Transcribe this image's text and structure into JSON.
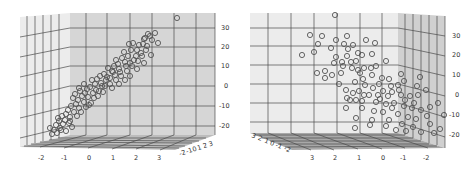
{
  "chart_data": [
    {
      "type": "scatter",
      "projection": "3d",
      "title": "",
      "view": "left panel, viewed with x-axis along bottom front edge",
      "xlabel": "",
      "ylabel": "",
      "zlabel": "",
      "x_ticks": [
        "-2",
        "-1",
        "0",
        "1",
        "2",
        "3"
      ],
      "y_ticks": [
        "-2",
        "-1",
        "0",
        "1",
        "2",
        "3"
      ],
      "z_ticks": [
        "30",
        "20",
        "10",
        "0",
        "-10",
        "-20"
      ],
      "xlim": [
        -2.5,
        3.5
      ],
      "ylim": [
        -2.5,
        3.5
      ],
      "zlim": [
        -25,
        35
      ],
      "grid": true,
      "marker": "open circle",
      "trend": "strong positive linear relation between x and z",
      "points_screen": [
        [
          177,
          18
        ],
        [
          155,
          33
        ],
        [
          158,
          43
        ],
        [
          145,
          38
        ],
        [
          148,
          34
        ],
        [
          150,
          36
        ],
        [
          143,
          44
        ],
        [
          144,
          39
        ],
        [
          152,
          40
        ],
        [
          139,
          45
        ],
        [
          147,
          46
        ],
        [
          137,
          50
        ],
        [
          141,
          53
        ],
        [
          136,
          56
        ],
        [
          131,
          50
        ],
        [
          128,
          56
        ],
        [
          134,
          60
        ],
        [
          125,
          62
        ],
        [
          130,
          63
        ],
        [
          122,
          58
        ],
        [
          118,
          64
        ],
        [
          126,
          66
        ],
        [
          119,
          69
        ],
        [
          114,
          66
        ],
        [
          112,
          71
        ],
        [
          120,
          72
        ],
        [
          108,
          68
        ],
        [
          115,
          75
        ],
        [
          110,
          78
        ],
        [
          104,
          74
        ],
        [
          106,
          80
        ],
        [
          100,
          76
        ],
        [
          101,
          83
        ],
        [
          97,
          79
        ],
        [
          95,
          84
        ],
        [
          102,
          86
        ],
        [
          92,
          80
        ],
        [
          90,
          87
        ],
        [
          96,
          90
        ],
        [
          87,
          89
        ],
        [
          93,
          93
        ],
        [
          85,
          93
        ],
        [
          88,
          97
        ],
        [
          82,
          96
        ],
        [
          80,
          91
        ],
        [
          78,
          100
        ],
        [
          84,
          102
        ],
        [
          76,
          104
        ],
        [
          73,
          98
        ],
        [
          71,
          106
        ],
        [
          79,
          108
        ],
        [
          68,
          110
        ],
        [
          74,
          112
        ],
        [
          66,
          114
        ],
        [
          70,
          117
        ],
        [
          62,
          116
        ],
        [
          65,
          120
        ],
        [
          59,
          121
        ],
        [
          63,
          124
        ],
        [
          56,
          125
        ],
        [
          60,
          128
        ],
        [
          54,
          130
        ],
        [
          52,
          134
        ],
        [
          57,
          133
        ],
        [
          50,
          128
        ],
        [
          72,
          127
        ],
        [
          66,
          131
        ],
        [
          61,
          130
        ],
        [
          89,
          105
        ],
        [
          94,
          98
        ],
        [
          99,
          91
        ],
        [
          105,
          86
        ],
        [
          110,
          84
        ],
        [
          116,
          80
        ],
        [
          121,
          76
        ],
        [
          127,
          71
        ],
        [
          132,
          66
        ],
        [
          138,
          61
        ],
        [
          142,
          56
        ],
        [
          146,
          50
        ],
        [
          113,
          72
        ],
        [
          107,
          77
        ],
        [
          103,
          92
        ],
        [
          98,
          96
        ],
        [
          91,
          103
        ],
        [
          86,
          107
        ],
        [
          81,
          112
        ],
        [
          77,
          116
        ],
        [
          70,
          121
        ],
        [
          116,
          60
        ],
        [
          124,
          52
        ],
        [
          119,
          84
        ],
        [
          112,
          88
        ],
        [
          84,
          84
        ],
        [
          79,
          88
        ],
        [
          133,
          43
        ],
        [
          129,
          44
        ],
        [
          151,
          55
        ],
        [
          144,
          63
        ],
        [
          137,
          69
        ],
        [
          130,
          76
        ],
        [
          125,
          80
        ],
        [
          69,
          123
        ],
        [
          58,
          118
        ],
        [
          75,
          94
        ]
      ]
    },
    {
      "type": "scatter",
      "projection": "3d",
      "title": "",
      "view": "right panel, rotated view with x-axis reversed along bottom front edge",
      "xlabel": "",
      "ylabel": "",
      "zlabel": "",
      "x_ticks": [
        "3",
        "2",
        "1",
        "0",
        "-1",
        "-2"
      ],
      "y_ticks": [
        "3",
        "2",
        "1",
        "0",
        "-1",
        "-2"
      ],
      "z_ticks": [
        "30",
        "20",
        "10",
        "0",
        "-10",
        "-20"
      ],
      "xlim": [
        3.5,
        -2.5
      ],
      "ylim": [
        3.5,
        -2.5
      ],
      "zlim": [
        -25,
        35
      ],
      "grid": true,
      "marker": "open circle",
      "trend": "points spread widely, cloud descends toward lower right",
      "points_screen": [
        [
          335,
          15
        ],
        [
          310,
          35
        ],
        [
          318,
          44
        ],
        [
          302,
          55
        ],
        [
          314,
          52
        ],
        [
          322,
          36
        ],
        [
          336,
          40
        ],
        [
          347,
          36
        ],
        [
          344,
          44
        ],
        [
          366,
          40
        ],
        [
          331,
          48
        ],
        [
          336,
          57
        ],
        [
          347,
          56
        ],
        [
          358,
          53
        ],
        [
          362,
          55
        ],
        [
          372,
          54
        ],
        [
          334,
          63
        ],
        [
          342,
          62
        ],
        [
          351,
          62
        ],
        [
          356,
          61
        ],
        [
          386,
          61
        ],
        [
          317,
          73
        ],
        [
          325,
          71
        ],
        [
          352,
          68
        ],
        [
          358,
          70
        ],
        [
          364,
          68
        ],
        [
          371,
          68
        ],
        [
          376,
          66
        ],
        [
          325,
          78
        ],
        [
          332,
          75
        ],
        [
          341,
          73
        ],
        [
          360,
          73
        ],
        [
          372,
          75
        ],
        [
          382,
          78
        ],
        [
          389,
          79
        ],
        [
          401,
          74
        ],
        [
          420,
          77
        ],
        [
          391,
          86
        ],
        [
          398,
          85
        ],
        [
          404,
          81
        ],
        [
          379,
          84
        ],
        [
          365,
          85
        ],
        [
          373,
          88
        ],
        [
          383,
          91
        ],
        [
          353,
          93
        ],
        [
          346,
          90
        ],
        [
          359,
          91
        ],
        [
          369,
          95
        ],
        [
          378,
          95
        ],
        [
          388,
          96
        ],
        [
          392,
          92
        ],
        [
          401,
          95
        ],
        [
          410,
          96
        ],
        [
          418,
          95
        ],
        [
          426,
          90
        ],
        [
          347,
          98
        ],
        [
          356,
          100
        ],
        [
          362,
          101
        ],
        [
          376,
          102
        ],
        [
          386,
          104
        ],
        [
          394,
          103
        ],
        [
          404,
          106
        ],
        [
          412,
          108
        ],
        [
          421,
          110
        ],
        [
          430,
          107
        ],
        [
          438,
          103
        ],
        [
          346,
          108
        ],
        [
          362,
          108
        ],
        [
          374,
          111
        ],
        [
          383,
          112
        ],
        [
          398,
          114
        ],
        [
          408,
          117
        ],
        [
          416,
          119
        ],
        [
          427,
          116
        ],
        [
          444,
          115
        ],
        [
          356,
          118
        ],
        [
          372,
          120
        ],
        [
          389,
          120
        ],
        [
          402,
          124
        ],
        [
          413,
          127
        ],
        [
          430,
          124
        ],
        [
          440,
          129
        ],
        [
          355,
          128
        ],
        [
          370,
          125
        ],
        [
          386,
          126
        ],
        [
          396,
          130
        ],
        [
          406,
          131
        ],
        [
          421,
          132
        ],
        [
          434,
          133
        ],
        [
          350,
          100
        ],
        [
          364,
          95
        ],
        [
          380,
          99
        ],
        [
          392,
          108
        ],
        [
          405,
          100
        ],
        [
          414,
          103
        ],
        [
          417,
          86
        ],
        [
          399,
          90
        ],
        [
          363,
          79
        ],
        [
          355,
          82
        ],
        [
          339,
          84
        ],
        [
          343,
          66
        ],
        [
          348,
          49
        ],
        [
          353,
          45
        ],
        [
          375,
          43
        ]
      ]
    }
  ]
}
